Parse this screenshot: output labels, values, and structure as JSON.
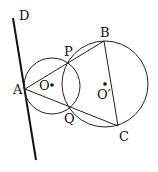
{
  "diagram": {
    "labels": {
      "D": "D",
      "A": "A",
      "P": "P",
      "Q": "Q",
      "B": "B",
      "C": "C",
      "O": "O",
      "O2": "O′"
    },
    "points": {
      "A": [
        25,
        89
      ],
      "P": [
        70,
        62
      ],
      "Q": [
        70,
        107
      ],
      "B": [
        104,
        41
      ],
      "C": [
        118,
        126
      ],
      "O": [
        52,
        85
      ],
      "O2": [
        105,
        84
      ],
      "D_top": [
        13,
        18
      ],
      "D_bottom": [
        36,
        160
      ]
    },
    "circles": [
      {
        "name": "circle-O",
        "cx": 52,
        "cy": 86,
        "r": 28
      },
      {
        "name": "circle-O2",
        "cx": 105,
        "cy": 84,
        "r": 43
      }
    ],
    "colors": {
      "stroke": "#111111",
      "background": "#ffffff"
    }
  }
}
